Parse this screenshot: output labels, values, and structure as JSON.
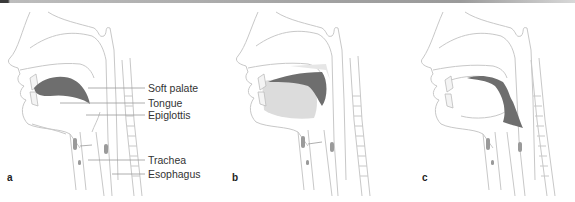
{
  "figure": {
    "panels": [
      {
        "letter": "a"
      },
      {
        "letter": "b"
      },
      {
        "letter": "c"
      }
    ],
    "labels": {
      "soft_palate": "Soft palate",
      "tongue": "Tongue",
      "epiglottis": "Epiglottis",
      "trachea": "Trachea",
      "esophagus": "Esophagus"
    },
    "colors": {
      "outline": "#c8c8c8",
      "bolus": "#6e6e6e",
      "tongue_shade": "#dcdcdc",
      "leader_line": "#9a9a9a"
    }
  }
}
